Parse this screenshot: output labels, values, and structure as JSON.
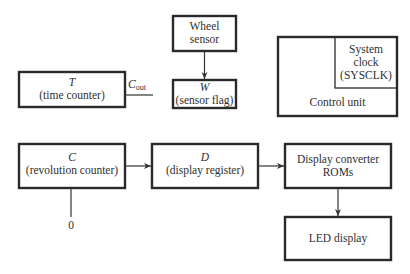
{
  "diagram": {
    "blocks": {
      "time_counter": {
        "symbol": "T",
        "name": "(time counter)"
      },
      "wheel_sensor": {
        "line1": "Wheel",
        "line2": "sensor"
      },
      "sensor_flag": {
        "symbol": "W",
        "name": "(sensor flag)"
      },
      "control_unit": {
        "name": "Control unit"
      },
      "system_clock": {
        "line1": "System",
        "line2": "clock",
        "line3": "(SYSCLK)"
      },
      "revolution_counter": {
        "symbol": "C",
        "name": "(revolution counter)"
      },
      "display_register": {
        "symbol": "D",
        "name": "(display register)"
      },
      "display_converter": {
        "line1": "Display converter",
        "line2": "ROMs"
      },
      "led_display": {
        "name": "LED display"
      }
    },
    "signals": {
      "carry_out": {
        "main": "C",
        "sub": "out"
      },
      "zero_input": "0"
    },
    "connections": [
      {
        "from": "wheel_sensor",
        "to": "sensor_flag"
      },
      {
        "from": "revolution_counter",
        "to": "display_register"
      },
      {
        "from": "display_register",
        "to": "display_converter"
      },
      {
        "from": "display_converter",
        "to": "led_display"
      },
      {
        "from": "time_counter",
        "to": "carry_out"
      },
      {
        "from": "zero_input",
        "to": "revolution_counter"
      }
    ]
  }
}
